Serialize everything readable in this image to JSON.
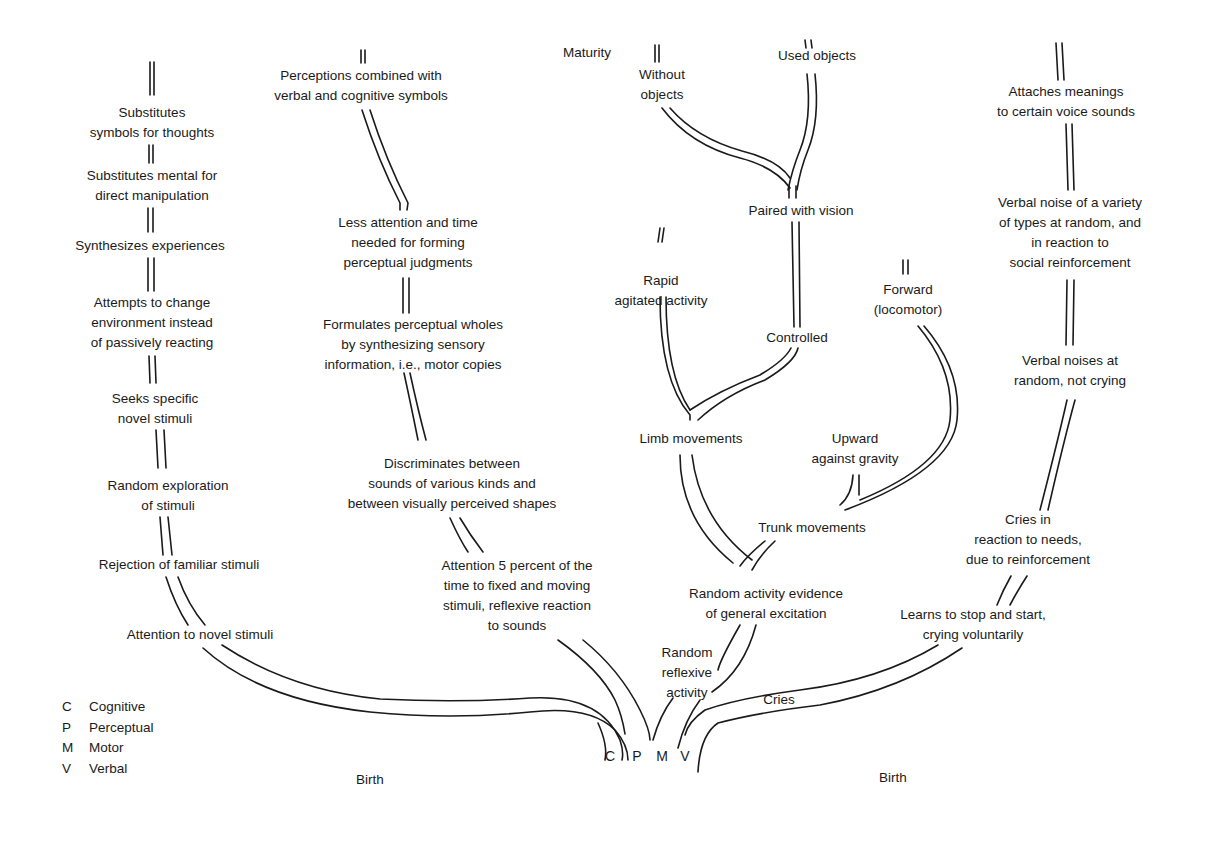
{
  "diagram": {
    "top_label": "Maturity",
    "bottom_labels": [
      "Birth",
      "Birth"
    ],
    "legend": [
      {
        "key": "C",
        "label": "Cognitive"
      },
      {
        "key": "P",
        "label": "Perceptual"
      },
      {
        "key": "M",
        "label": "Motor"
      },
      {
        "key": "V",
        "label": "Verbal"
      }
    ],
    "root_letters": [
      "C",
      "P",
      "M",
      "V"
    ],
    "branches": {
      "cognitive": {
        "nodes": [
          {
            "lines": [
              "Substitutes",
              "symbols for thoughts"
            ]
          },
          {
            "lines": [
              "Substitutes mental for",
              "direct manipulation"
            ]
          },
          {
            "lines": [
              "Synthesizes experiences"
            ]
          },
          {
            "lines": [
              "Attempts to change",
              "environment instead",
              "of passively reacting"
            ]
          },
          {
            "lines": [
              "Seeks specific",
              "novel stimuli"
            ]
          },
          {
            "lines": [
              "Random exploration",
              "of stimuli"
            ]
          },
          {
            "lines": [
              "Rejection of familiar stimuli"
            ]
          },
          {
            "lines": [
              "Attention to novel stimuli"
            ]
          }
        ]
      },
      "perceptual": {
        "nodes": [
          {
            "lines": [
              "Perceptions combined with",
              "verbal and cognitive symbols"
            ]
          },
          {
            "lines": [
              "Less attention and time",
              "needed for forming",
              "perceptual judgments"
            ]
          },
          {
            "lines": [
              "Formulates perceptual wholes",
              "by synthesizing sensory",
              "information, i.e., motor copies"
            ]
          },
          {
            "lines": [
              "Discriminates between",
              "sounds of various kinds and",
              "between visually perceived shapes"
            ]
          },
          {
            "lines": [
              "Attention 5 percent of the",
              "time to fixed and moving",
              "stimuli, reflexive reaction",
              "to sounds"
            ]
          }
        ]
      },
      "motor": {
        "nodes": [
          {
            "lines": [
              "Without",
              "objects"
            ]
          },
          {
            "lines": [
              "Used objects"
            ]
          },
          {
            "lines": [
              "Paired with vision"
            ]
          },
          {
            "lines": [
              "Rapid",
              "agitated activity"
            ]
          },
          {
            "lines": [
              "Controlled"
            ]
          },
          {
            "lines": [
              "Forward",
              "(locomotor)"
            ]
          },
          {
            "lines": [
              "Limb movements"
            ]
          },
          {
            "lines": [
              "Upward",
              "against gravity"
            ]
          },
          {
            "lines": [
              "Trunk movements"
            ]
          },
          {
            "lines": [
              "Random activity evidence",
              "of general excitation"
            ]
          },
          {
            "lines": [
              "Random",
              "reflexive",
              "activity"
            ]
          }
        ]
      },
      "verbal": {
        "nodes": [
          {
            "lines": [
              "Attaches meanings",
              "to certain voice sounds"
            ]
          },
          {
            "lines": [
              "Verbal noise of a variety",
              "of types at random, and",
              "in reaction to",
              "social reinforcement"
            ]
          },
          {
            "lines": [
              "Verbal noises at",
              "random, not crying"
            ]
          },
          {
            "lines": [
              "Cries in",
              "reaction to needs,",
              "due to reinforcement"
            ]
          },
          {
            "lines": [
              "Learns to stop and start,",
              "crying voluntarily"
            ]
          },
          {
            "lines": [
              "Cries"
            ]
          }
        ]
      }
    }
  }
}
